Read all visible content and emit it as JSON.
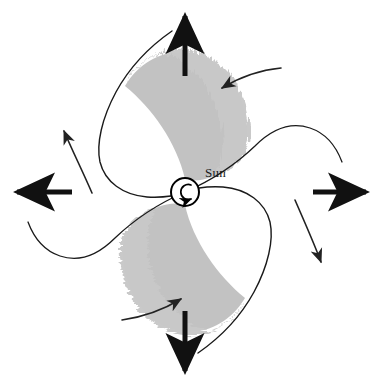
{
  "figure": {
    "background_color": "#ffffff",
    "width": 379,
    "height": 388,
    "center": {
      "x": 185,
      "y": 192
    }
  },
  "labels": {
    "sun": "Sun"
  },
  "colors": {
    "arm_fill": "#c2c2c2",
    "arm_fill_feather": "#cccccc",
    "outline": "#1a1a1a",
    "arrow": "#111111",
    "curve_arrow": "#222222",
    "sun_circle_stroke": "#000000",
    "sun_circle_fill": "#ffffff",
    "label_color": "#1a1a1a"
  },
  "sun": {
    "name": "Sun",
    "cx": 185,
    "cy": 192,
    "radius": 14,
    "rotation_direction": "counterclockwise",
    "rotation_glyph": "counterclockwise-arrow"
  },
  "spiral_arms": [
    {
      "id": "upper-arm",
      "name": "upper-spiral-arm",
      "fill": "#c2c2c2",
      "leading_edge": "feathered",
      "leading_edge_side": "upper-right",
      "trailing_edge": "solid-outline",
      "tip_direction": "up-left"
    },
    {
      "id": "lower-arm",
      "name": "lower-spiral-arm",
      "fill": "#c2c2c2",
      "leading_edge": "feathered",
      "leading_edge_side": "lower-left",
      "trailing_edge": "solid-outline",
      "tip_direction": "down-right"
    }
  ],
  "outline_curves": [
    {
      "id": "curve-upper-right",
      "name": "arm-outline-upper-right",
      "description": "free spiral outline sweeping to the upper right"
    },
    {
      "id": "curve-lower-left",
      "name": "arm-outline-lower-left",
      "description": "free spiral outline sweeping to the lower left"
    },
    {
      "id": "curve-upper-tip",
      "name": "arm-outline-upper-tip",
      "description": "outer boundary of upper arm extending past the fill"
    },
    {
      "id": "curve-lower-tip",
      "name": "arm-outline-lower-tip",
      "description": "outer boundary of lower arm extending past the fill"
    }
  ],
  "straight_arrows": [
    {
      "id": "arrow-up",
      "name": "outward-arrow-up",
      "direction": "up",
      "x1": 185,
      "y1": 75,
      "x2": 185,
      "y2": 12
    },
    {
      "id": "arrow-right",
      "name": "outward-arrow-right",
      "direction": "right",
      "x1": 313,
      "y1": 192,
      "x2": 370,
      "y2": 192
    },
    {
      "id": "arrow-down",
      "name": "outward-arrow-down",
      "direction": "down",
      "x1": 185,
      "y1": 312,
      "x2": 185,
      "y2": 375
    },
    {
      "id": "arrow-left",
      "name": "outward-arrow-left",
      "direction": "left",
      "x1": 73,
      "y1": 192,
      "x2": 13,
      "y2": 192
    }
  ],
  "curved_arrows": [
    {
      "id": "flow-upper-right",
      "name": "flow-arrow-upper-right",
      "direction": "inward-left",
      "description": "thin curved arrow above the upper arm pointing left"
    },
    {
      "id": "flow-upper-left",
      "name": "flow-arrow-upper-left",
      "direction": "up",
      "description": "thin curved arrow on the left pointing up"
    },
    {
      "id": "flow-lower-left",
      "name": "flow-arrow-lower-left",
      "direction": "inward-right",
      "description": "thin curved arrow below the lower arm pointing right"
    },
    {
      "id": "flow-lower-right",
      "name": "flow-arrow-lower-right",
      "direction": "down",
      "description": "thin curved arrow on the right pointing down"
    }
  ]
}
